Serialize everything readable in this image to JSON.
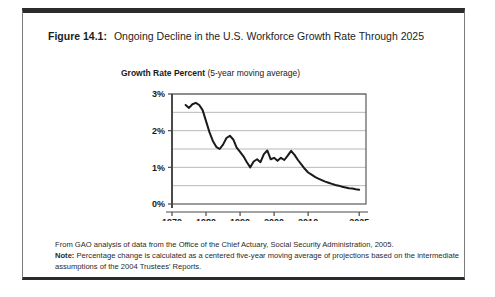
{
  "figure": {
    "label": "Figure 14.1:",
    "title": "Ongoing Decline in the U.S. Workforce Growth Rate Through 2025",
    "subtitle_bold": "Growth Rate Percent",
    "subtitle_regular": " (5-year moving average)"
  },
  "footnotes": {
    "source": "From GAO analysis of data from the Office of the Chief Actuary, Social Security Administration, 2005.",
    "note_label": "Note:",
    "note_text": " Percentage change is calculated as a centered five-year moving average of projections based on the intermediate assumptions of the 2004 Trustees' Reports."
  },
  "colors": {
    "line": "#1a1a1a",
    "gridline": "#b8b8b8",
    "axis": "#5a5a5a",
    "frame_top": "#2b2b2b",
    "text": "#1a1a1a"
  },
  "chart_data": {
    "type": "line",
    "title": "Ongoing Decline in the U.S. Workforce Growth Rate Through 2025",
    "xlabel": "",
    "ylabel": "Growth Rate Percent (5-year moving average)",
    "xlim": [
      1970,
      2027
    ],
    "ylim": [
      0,
      3
    ],
    "grid": true,
    "grid_y_step": 0.5,
    "legend": "none",
    "xticks": [
      1970,
      1980,
      1990,
      2000,
      2010,
      2025
    ],
    "xtick_labels": [
      "1970",
      "1980",
      "1990",
      "2000",
      "2010",
      "2025"
    ],
    "yticks": [
      0,
      1,
      2,
      3
    ],
    "ytick_labels": [
      "0%",
      "1%",
      "2%",
      "3%"
    ],
    "series": [
      {
        "name": "U.S. workforce growth rate (5-year moving average)",
        "x": [
          1974,
          1975,
          1976,
          1977,
          1978,
          1979,
          1980,
          1981,
          1982,
          1983,
          1984,
          1985,
          1986,
          1987,
          1988,
          1989,
          1990,
          1991,
          1992,
          1993,
          1994,
          1995,
          1996,
          1997,
          1998,
          1999,
          2000,
          2001,
          2002,
          2003,
          2004,
          2005,
          2006,
          2007,
          2008,
          2009,
          2010,
          2011,
          2012,
          2013,
          2014,
          2015,
          2016,
          2017,
          2018,
          2019,
          2020,
          2021,
          2022,
          2023,
          2024,
          2025
        ],
        "values": [
          2.7,
          2.62,
          2.72,
          2.76,
          2.7,
          2.56,
          2.26,
          1.96,
          1.72,
          1.56,
          1.5,
          1.62,
          1.8,
          1.86,
          1.76,
          1.54,
          1.42,
          1.3,
          1.14,
          1.0,
          1.16,
          1.22,
          1.14,
          1.36,
          1.46,
          1.22,
          1.26,
          1.18,
          1.26,
          1.2,
          1.32,
          1.45,
          1.34,
          1.2,
          1.08,
          0.96,
          0.86,
          0.8,
          0.74,
          0.69,
          0.65,
          0.61,
          0.58,
          0.55,
          0.52,
          0.5,
          0.47,
          0.45,
          0.43,
          0.42,
          0.4,
          0.39
        ]
      }
    ]
  }
}
